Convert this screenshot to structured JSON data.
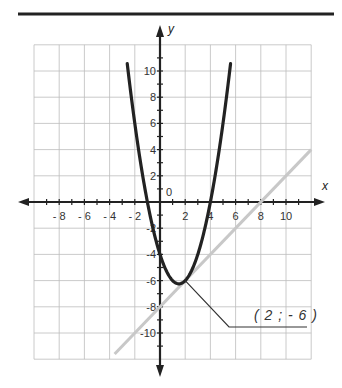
{
  "chart_data": {
    "type": "line",
    "title": "",
    "xlabel": "x",
    "ylabel": "y",
    "xlim": [
      -10,
      12
    ],
    "ylim": [
      -12,
      12
    ],
    "grid": true,
    "grid_step": 2,
    "origin_label": "0",
    "x_tick_labels": [
      "- 8",
      "- 6",
      "- 4",
      "- 2",
      "2",
      "4",
      "6",
      "8",
      "10"
    ],
    "x_tick_values": [
      -8,
      -6,
      -4,
      -2,
      2,
      4,
      6,
      8,
      10
    ],
    "y_tick_labels": [
      "10",
      "8",
      "6",
      "4",
      "2",
      "-2",
      "-4",
      "-6",
      "-8",
      "-10"
    ],
    "y_tick_values": [
      10,
      8,
      6,
      4,
      2,
      -2,
      -4,
      -6,
      -8,
      -10
    ],
    "series": [
      {
        "name": "parabola",
        "equation": "y = x^2 - 3x - 4",
        "color": "#222222",
        "x_range": [
          -2.6,
          5.6
        ],
        "points": [
          [
            -2.6,
            11.56
          ],
          [
            -2,
            6
          ],
          [
            -1,
            0
          ],
          [
            0,
            -4
          ],
          [
            1,
            -6
          ],
          [
            1.5,
            -6.25
          ],
          [
            2,
            -6
          ],
          [
            3,
            -4
          ],
          [
            4,
            0
          ],
          [
            5,
            6
          ],
          [
            5.6,
            10.56
          ]
        ]
      },
      {
        "name": "tangent line",
        "equation": "y = x - 8",
        "color": "#c8c8c8",
        "x_range": [
          -3.6,
          12
        ],
        "points": [
          [
            -3.6,
            -11.6
          ],
          [
            0,
            -8
          ],
          [
            2,
            -6
          ],
          [
            8,
            0
          ],
          [
            12,
            4
          ]
        ]
      }
    ],
    "annotations": [
      {
        "text": "( 2 ; - 6 )",
        "point": [
          2,
          -6
        ]
      }
    ]
  }
}
